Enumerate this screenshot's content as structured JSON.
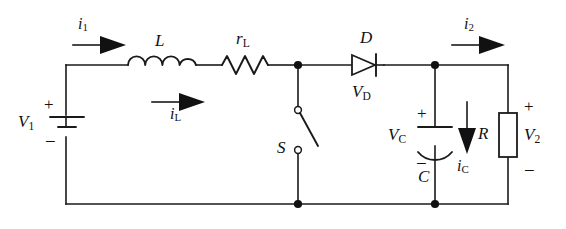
{
  "figure": {
    "name": "boost-converter-circuit",
    "type": "schematic",
    "width": 566,
    "height": 229,
    "background_color": "#ffffff",
    "line_color": "#1a1a1a"
  },
  "labels": {
    "source": {
      "symbol": "V",
      "subscript": "1",
      "plus": "+",
      "minus": "−"
    },
    "inductor": {
      "symbol": "L"
    },
    "inductor_resistance": {
      "symbol": "r",
      "subscript": "L"
    },
    "switch": {
      "symbol": "S",
      "state": "open"
    },
    "diode": {
      "symbol": "D"
    },
    "diode_voltage": {
      "symbol": "V",
      "subscript": "D"
    },
    "capacitor": {
      "symbol": "C",
      "plus": "+",
      "minus": "−"
    },
    "capacitor_voltage": {
      "symbol": "V",
      "subscript": "C"
    },
    "resistor": {
      "symbol": "R"
    },
    "output_voltage": {
      "symbol": "V",
      "subscript": "2",
      "plus": "+",
      "minus": "−"
    },
    "current_input": {
      "symbol": "i",
      "subscript": "1"
    },
    "current_inductor": {
      "symbol": "i",
      "subscript": "L"
    },
    "current_output": {
      "symbol": "i",
      "subscript": "2"
    },
    "current_capacitor": {
      "symbol": "i",
      "subscript": "C"
    }
  },
  "components": [
    {
      "id": "V1",
      "kind": "battery",
      "label": "V1",
      "orientation": "vertical"
    },
    {
      "id": "L",
      "kind": "inductor",
      "label": "L",
      "orientation": "horizontal",
      "coils": 4
    },
    {
      "id": "rL",
      "kind": "resistor-zigzag",
      "label": "rL",
      "orientation": "horizontal"
    },
    {
      "id": "S",
      "kind": "switch-spst-open",
      "label": "S",
      "orientation": "vertical"
    },
    {
      "id": "D",
      "kind": "diode",
      "label": "D",
      "orientation": "horizontal",
      "direction": "right"
    },
    {
      "id": "C",
      "kind": "capacitor-polarized",
      "label": "C",
      "orientation": "vertical"
    },
    {
      "id": "R",
      "kind": "resistor-box",
      "label": "R",
      "orientation": "vertical"
    }
  ],
  "current_arrows": [
    {
      "id": "i1",
      "label": "i1",
      "direction": "right"
    },
    {
      "id": "iL",
      "label": "iL",
      "direction": "right"
    },
    {
      "id": "i2",
      "label": "i2",
      "direction": "right"
    },
    {
      "id": "iC",
      "label": "iC",
      "direction": "down"
    }
  ]
}
